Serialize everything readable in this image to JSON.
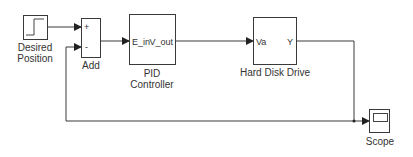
{
  "diagram": {
    "type": "simulink-block-diagram",
    "blocks": {
      "step": {
        "label_line1": "Desired",
        "label_line2": "Position",
        "icon": "step-icon"
      },
      "add": {
        "label": "Add",
        "port_plus": "+",
        "port_minus": "-"
      },
      "pid": {
        "label_line1": "PID",
        "label_line2": "Controller",
        "input_port": "E_in",
        "output_port": "V_out"
      },
      "hdd": {
        "label": "Hard Disk Drive",
        "input_port": "Va",
        "output_port": "Y"
      },
      "scope": {
        "label": "Scope",
        "icon": "scope-screen-icon"
      }
    },
    "connections": [
      {
        "from": "Desired Position",
        "to": "Add (+)"
      },
      {
        "from": "Add",
        "to": "PID Controller (E_in)"
      },
      {
        "from": "PID Controller (V_out)",
        "to": "Hard Disk Drive (Va)"
      },
      {
        "from": "Hard Disk Drive (Y)",
        "to": "Scope"
      },
      {
        "from": "Hard Disk Drive (Y)",
        "to": "Add (-)",
        "kind": "feedback"
      }
    ],
    "colors": {
      "line": "#3a3a3a",
      "background": "#ffffff",
      "text": "#333333"
    }
  }
}
